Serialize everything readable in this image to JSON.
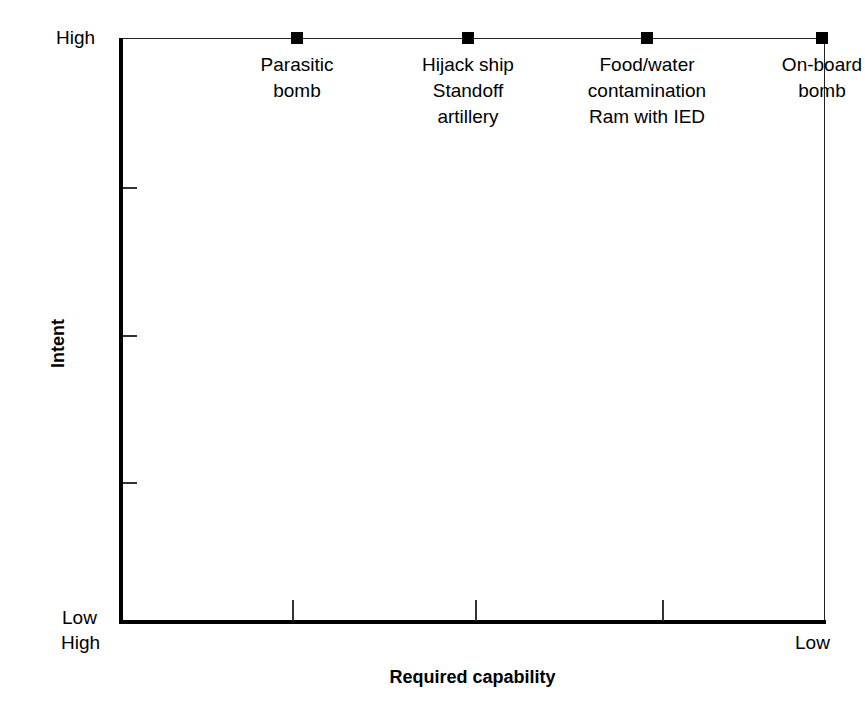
{
  "chart_data": {
    "type": "scatter",
    "title": "",
    "xlabel": "Required capability",
    "ylabel": "Intent",
    "x_tick_labels": [
      "High",
      "Low"
    ],
    "y_tick_labels": [
      "High",
      "Low"
    ],
    "xlim_labels": {
      "left": "High",
      "right": "Low"
    },
    "ylim_labels": {
      "top": "High",
      "bottom": "Low"
    },
    "grid": false,
    "legend": "none",
    "x_axis_direction": "high-to-low",
    "y_axis_direction": "low-to-high",
    "x_interior_ticks_px": [
      292,
      475,
      662
    ],
    "y_interior_ticks_px": [
      187,
      335,
      482
    ],
    "marker_style": "filled-square",
    "marker_color": "#000000",
    "points": [
      {
        "id": "parasitic-bomb",
        "x_px": 297,
        "intent": "High",
        "required_capability": "High",
        "labels": [
          "Parasitic",
          "bomb"
        ]
      },
      {
        "id": "hijack-ship-standoff-artillery",
        "x_px": 468,
        "intent": "High",
        "required_capability": "Medium-high",
        "labels": [
          "Hijack ship",
          "Standoff",
          "artillery"
        ]
      },
      {
        "id": "food-water-contamination-ram-with-ied",
        "x_px": 647,
        "intent": "High",
        "required_capability": "Medium-low",
        "labels": [
          "Food/water",
          "contamination",
          "Ram with IED"
        ]
      },
      {
        "id": "on-board-bomb",
        "x_px": 822,
        "intent": "High",
        "required_capability": "Low",
        "labels": [
          "On-board",
          "bomb"
        ]
      }
    ]
  },
  "axes": {
    "y": {
      "title": "Intent",
      "top_label": "High",
      "bottom_label": "Low"
    },
    "x": {
      "title": "Required capability",
      "left_label": "High",
      "right_label": "Low"
    }
  }
}
